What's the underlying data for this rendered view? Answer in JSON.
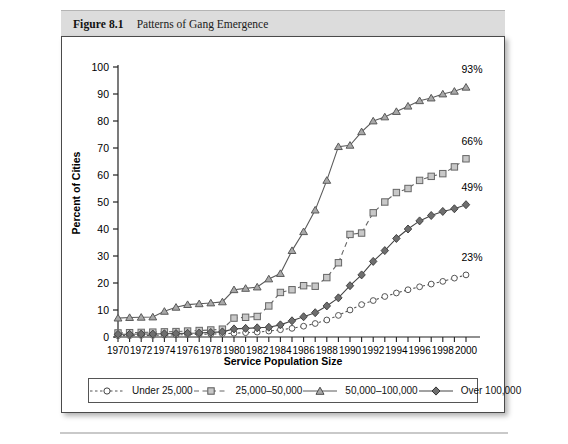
{
  "figure": {
    "number": "Figure 8.1",
    "caption": "Patterns of Gang Emergence"
  },
  "chart_data": {
    "type": "line",
    "title": "Patterns of Gang Emergence",
    "xlabel": "Service Population Size",
    "ylabel": "Percent of Cities",
    "xlim": [
      1970,
      2000
    ],
    "ylim": [
      0,
      100
    ],
    "ytick_step": 10,
    "yticks": [
      0,
      10,
      20,
      30,
      40,
      50,
      60,
      70,
      80,
      90,
      100
    ],
    "xticks_major": [
      1970,
      1972,
      1974,
      1976,
      1978,
      1980,
      1982,
      1984,
      1986,
      1988,
      1990,
      1992,
      1994,
      1996,
      1998,
      2000
    ],
    "xticks_minor_every": 1,
    "grid": false,
    "legend_position": "bottom",
    "x": [
      1970,
      1971,
      1972,
      1973,
      1974,
      1975,
      1976,
      1977,
      1978,
      1979,
      1980,
      1981,
      1982,
      1983,
      1984,
      1985,
      1986,
      1987,
      1988,
      1989,
      1990,
      1991,
      1992,
      1993,
      1994,
      1995,
      1996,
      1997,
      1998,
      1999,
      2000
    ],
    "series": [
      {
        "name": "Under 25,000",
        "marker": "circle",
        "line_style": "dotted",
        "color": "#555555",
        "marker_fill": "#ffffff",
        "end_label": "23%",
        "end_value": 23,
        "values": [
          0.5,
          0.5,
          0.6,
          0.6,
          0.7,
          0.8,
          0.9,
          1.0,
          1.1,
          1.2,
          1.4,
          1.6,
          1.8,
          2.2,
          2.7,
          3.2,
          4.0,
          5.0,
          6.3,
          8.0,
          10.0,
          12.0,
          13.5,
          15.0,
          16.3,
          17.5,
          18.6,
          19.6,
          20.6,
          21.8,
          23.0
        ]
      },
      {
        "name": "25,000–50,000",
        "marker": "square",
        "line_style": "dashed",
        "color": "#666666",
        "marker_fill": "#c8c8c8",
        "end_label": "66%",
        "end_value": 66,
        "values": [
          1.5,
          1.6,
          1.7,
          1.8,
          1.9,
          2.0,
          2.2,
          2.4,
          2.6,
          2.9,
          7.0,
          7.3,
          7.6,
          11.5,
          16.5,
          17.5,
          19.0,
          18.8,
          22.0,
          27.5,
          38.0,
          38.5,
          46.0,
          50.0,
          53.5,
          55.0,
          58.0,
          59.5,
          60.5,
          63.0,
          66.0
        ]
      },
      {
        "name": "50,000–100,000",
        "marker": "triangle",
        "line_style": "solid",
        "color": "#5a5a5a",
        "marker_fill": "#a8a8a8",
        "end_label": "93%",
        "end_value": 93,
        "values": [
          7.0,
          7.2,
          7.3,
          7.4,
          9.5,
          11.0,
          12.0,
          12.3,
          12.6,
          13.0,
          17.5,
          18.0,
          18.5,
          21.5,
          23.5,
          32.0,
          39.0,
          47.0,
          58.0,
          70.5,
          71.0,
          76.0,
          80.0,
          81.5,
          83.5,
          85.5,
          87.5,
          88.5,
          90.0,
          91.0,
          92.5
        ]
      },
      {
        "name": "Over 100,000",
        "marker": "diamond",
        "line_style": "solid",
        "color": "#444444",
        "marker_fill": "#6e6e6e",
        "end_label": "49%",
        "end_value": 49,
        "values": [
          1.0,
          1.0,
          1.1,
          1.1,
          1.2,
          1.3,
          1.4,
          1.5,
          1.7,
          1.9,
          3.0,
          3.2,
          3.4,
          3.6,
          4.5,
          6.0,
          7.5,
          9.0,
          11.5,
          14.5,
          19.0,
          23.0,
          28.0,
          32.0,
          36.5,
          40.0,
          43.0,
          45.0,
          46.5,
          47.5,
          49.0
        ]
      }
    ]
  },
  "legend": {
    "items": [
      {
        "label": "Under 25,000"
      },
      {
        "label": "25,000–50,000"
      },
      {
        "label": "50,000–100,000"
      },
      {
        "label": "Over 100,000"
      }
    ]
  }
}
